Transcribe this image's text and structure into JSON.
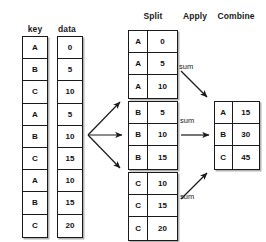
{
  "diagram": {
    "background": "#ffffff",
    "line_color": "#1a1a1a"
  },
  "headers": {
    "key": "key",
    "data": "data",
    "split": "Split",
    "apply": "Apply",
    "combine": "Combine"
  },
  "input": {
    "key_column": [
      "A",
      "B",
      "C",
      "A",
      "B",
      "C",
      "A",
      "B",
      "C"
    ],
    "data_column": [
      "0",
      "5",
      "10",
      "5",
      "10",
      "15",
      "10",
      "15",
      "20"
    ]
  },
  "split_groups": [
    {
      "name": "group-a",
      "rows": [
        {
          "key": "A",
          "value": "0"
        },
        {
          "key": "A",
          "value": "5"
        },
        {
          "key": "A",
          "value": "10"
        }
      ]
    },
    {
      "name": "group-b",
      "rows": [
        {
          "key": "B",
          "value": "5"
        },
        {
          "key": "B",
          "value": "10"
        },
        {
          "key": "B",
          "value": "15"
        }
      ]
    },
    {
      "name": "group-c",
      "rows": [
        {
          "key": "C",
          "value": "10"
        },
        {
          "key": "C",
          "value": "15"
        },
        {
          "key": "C",
          "value": "20"
        }
      ]
    }
  ],
  "apply": {
    "labels": [
      "sum",
      "sum",
      "sum"
    ]
  },
  "combine": {
    "rows": [
      {
        "key": "A",
        "value": "15"
      },
      {
        "key": "B",
        "value": "30"
      },
      {
        "key": "C",
        "value": "45"
      }
    ]
  }
}
